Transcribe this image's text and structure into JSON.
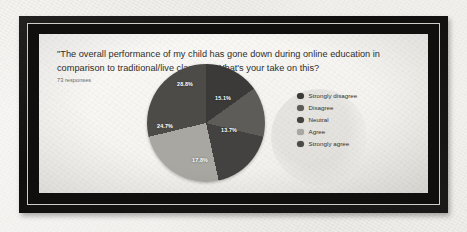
{
  "card": {
    "question": "\"The overall performance of my child has gone down during online education in comparison to traditional/live classes.\" What's your take on this?",
    "responses": "73 responses"
  },
  "chart_data": {
    "type": "pie",
    "title": "\"The overall performance of my child has gone down during online education in comparison to traditional/live classes.\" What's your take on this?",
    "subtitle": "73 responses",
    "legend_position": "right",
    "total_responses": 73,
    "categories": [
      "Strongly disagree",
      "Disagree",
      "Neutral",
      "Agree",
      "Strongly agree"
    ],
    "values": [
      15.1,
      13.7,
      17.8,
      24.7,
      28.8
    ],
    "labels": [
      "15.1%",
      "13.7%",
      "17.8%",
      "24.7%",
      "28.8%"
    ],
    "colors": [
      "#3b3a38",
      "#5e5c58",
      "#434240",
      "#a9a7a2",
      "#4c4b48"
    ],
    "slices": [
      {
        "label": "Strongly disagree",
        "value": 15.1,
        "display": "15.1%",
        "color": "#3b3a38",
        "label_x": 76,
        "label_y": 34
      },
      {
        "label": "Disagree",
        "value": 13.7,
        "display": "13.7%",
        "color": "#5e5c58",
        "label_x": 82,
        "label_y": 66
      },
      {
        "label": "Neutral",
        "value": 17.8,
        "display": "17.8%",
        "color": "#434240",
        "label_x": 53,
        "label_y": 96
      },
      {
        "label": "Agree",
        "value": 24.7,
        "display": "24.7%",
        "color": "#a9a7a2",
        "label_x": 18,
        "label_y": 62
      },
      {
        "label": "Strongly agree",
        "value": 28.8,
        "display": "28.8%",
        "color": "#4c4b48",
        "label_x": 38,
        "label_y": 20
      }
    ]
  },
  "legend": {
    "items": [
      {
        "label": "Strongly disagree",
        "color": "#3b3a38"
      },
      {
        "label": "Disagree",
        "color": "#5e5c58"
      },
      {
        "label": "Neutral",
        "color": "#434240"
      },
      {
        "label": "Agree",
        "color": "#a9a7a2"
      },
      {
        "label": "Strongly agree",
        "color": "#4c4b48"
      }
    ]
  }
}
